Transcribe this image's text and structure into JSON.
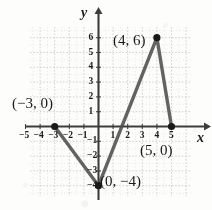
{
  "chart_data": {
    "type": "line",
    "title": "",
    "xlabel": "x",
    "ylabel": "y",
    "grid": true,
    "legend": "none",
    "xlim": [
      -6,
      6.3
    ],
    "ylim": [
      -5.2,
      6.8
    ],
    "xticks": [
      -5,
      -4,
      -3,
      -2,
      -1,
      1,
      2,
      3,
      4,
      5
    ],
    "yticks": [
      6,
      5,
      4,
      3,
      2,
      1,
      -1,
      -2,
      -3,
      -4
    ],
    "xticklabels": [
      "−5",
      "−4",
      "−3",
      "−2",
      "−1",
      "1",
      "2",
      "3",
      "4",
      "5"
    ],
    "yticklabels": [
      "6",
      "5",
      "4",
      "3",
      "2",
      "1",
      "−1",
      "−2",
      "−3",
      "−4"
    ],
    "series": [
      {
        "name": "piecewise-path",
        "points": [
          {
            "x": -3,
            "y": 0
          },
          {
            "x": 0,
            "y": -4
          },
          {
            "x": 4,
            "y": 6
          },
          {
            "x": 5,
            "y": 0
          }
        ]
      }
    ],
    "markers": [
      {
        "x": -3,
        "y": 0,
        "label": "(−3, 0)"
      },
      {
        "x": 0,
        "y": -4,
        "label": "(0, −4)"
      },
      {
        "x": 4,
        "y": 6,
        "label": "(4, 6)"
      },
      {
        "x": 5,
        "y": 0,
        "label": "(5, 0)"
      }
    ],
    "annotations": [
      {
        "name": "point-label-neg3-0",
        "text": "(−3, 0)",
        "left": 12,
        "top": 96
      },
      {
        "name": "point-label-4-6",
        "text": "(4, 6)",
        "left": 113,
        "top": 33
      },
      {
        "name": "point-label-5-0",
        "text": "(5, 0)",
        "left": 140,
        "top": 143
      },
      {
        "name": "point-label-0-neg4",
        "text": "(0, −4)",
        "left": 100,
        "top": 174
      }
    ],
    "colors": {
      "curve": "#4d4d4d",
      "axis": "#3d3d3d",
      "grid": "#c9c9cf",
      "marker": "#1a1a1a",
      "background": "#fdfdfb",
      "text": "#1a1a1a"
    },
    "geometry": {
      "origin_x": 98.5,
      "origin_y": 126.5,
      "unit_x": 14.6,
      "unit_y": 14.8,
      "grid_left": 30,
      "grid_right": 191,
      "grid_top": 27,
      "grid_bottom": 196
    }
  },
  "axis_labels": {
    "x": "x",
    "y": "y"
  }
}
